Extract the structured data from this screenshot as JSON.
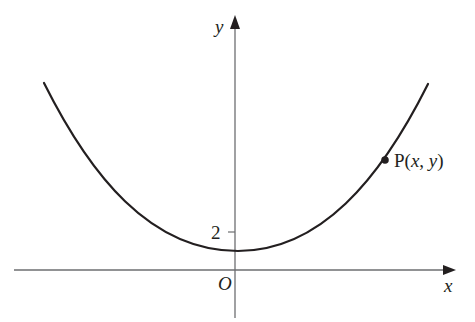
{
  "diagram": {
    "type": "function-graph",
    "axes": {
      "x_label": "x",
      "y_label": "y",
      "origin_label": "O",
      "y_tick_label": "2"
    },
    "point": {
      "label_prefix": "P(",
      "label_x": "x",
      "label_sep": ", ",
      "label_y": "y",
      "label_suffix": ")"
    },
    "colors": {
      "curve": "#231f20",
      "axes": "#6d6e71",
      "text": "#231f20"
    }
  }
}
